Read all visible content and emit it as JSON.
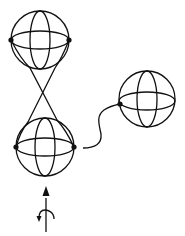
{
  "diagram": {
    "type": "topology-sketch",
    "colors": {
      "ink": "#111111",
      "background": "#ffffff"
    },
    "spheres": [
      {
        "id": "top-sphere",
        "cx": 40,
        "cy": 40,
        "r": 29,
        "equator_ry": 9,
        "meridian_rx": 10,
        "dots": [
          [
            11,
            40
          ],
          [
            69,
            40
          ]
        ]
      },
      {
        "id": "bottom-sphere",
        "cx": 45,
        "cy": 147,
        "r": 29,
        "equator_ry": 9,
        "meridian_rx": 10,
        "dots": [
          [
            16,
            147
          ],
          [
            74,
            147
          ]
        ]
      },
      {
        "id": "right-sphere",
        "cx": 147,
        "cy": 99,
        "r": 28,
        "equator_ry": 9,
        "meridian_rx": 10,
        "dots": [
          [
            120,
            104
          ]
        ]
      }
    ],
    "connectors": [
      {
        "id": "cross-line-1",
        "kind": "straight",
        "from": "top-sphere",
        "to": "bottom-sphere"
      },
      {
        "id": "cross-line-2",
        "kind": "straight",
        "from": "top-sphere",
        "to": "bottom-sphere"
      },
      {
        "id": "wavy-connector",
        "kind": "curve",
        "from": "bottom-sphere",
        "to": "right-sphere"
      }
    ],
    "symbols": [
      {
        "id": "up-arrow",
        "meaning": "arrow-up"
      },
      {
        "id": "rotation-hook",
        "meaning": "rotation"
      }
    ]
  }
}
